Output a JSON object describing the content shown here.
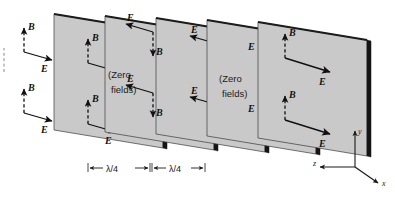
{
  "figure": {
    "kind": "physics-diagram",
    "background_color": "#ffffff",
    "panel_fill": "#c9c9c9",
    "panel_edge": "#151515",
    "ink": "#101010"
  },
  "panels": [
    {
      "id": "panel-1",
      "index": 1,
      "type": "field",
      "label": "",
      "vectors": [
        {
          "name": "B",
          "label": "B",
          "style": "dashed",
          "direction": "up"
        },
        {
          "name": "E",
          "label": "E",
          "style": "solid",
          "direction": "right"
        },
        {
          "name": "B",
          "label": "B",
          "style": "dashed",
          "direction": "up"
        },
        {
          "name": "E",
          "label": "E",
          "style": "solid",
          "direction": "right"
        },
        {
          "name": "B",
          "label": "B",
          "style": "dashed",
          "direction": "up"
        },
        {
          "name": "E",
          "label": "E",
          "style": "solid",
          "direction": "right"
        },
        {
          "name": "B",
          "label": "B",
          "style": "dashed",
          "direction": "up"
        },
        {
          "name": "E",
          "label": "E",
          "style": "solid",
          "direction": "right"
        }
      ]
    },
    {
      "id": "panel-2",
      "index": 2,
      "type": "zero",
      "label": "(Zero\nfields)",
      "label_line1": "(Zero",
      "label_line2": "fields)",
      "vectors": []
    },
    {
      "id": "panel-3",
      "index": 3,
      "type": "field-reversed",
      "label": "",
      "vectors": [
        {
          "name": "E",
          "label": "E",
          "style": "solid",
          "direction": "left"
        },
        {
          "name": "B",
          "label": "B",
          "style": "dashed",
          "direction": "down"
        },
        {
          "name": "E",
          "label": "E",
          "style": "solid",
          "direction": "left"
        },
        {
          "name": "B",
          "label": "B",
          "style": "dashed",
          "direction": "down"
        },
        {
          "name": "E",
          "label": "E",
          "style": "solid",
          "direction": "left"
        },
        {
          "name": "B",
          "label": "B",
          "style": "dashed",
          "direction": "down"
        },
        {
          "name": "E",
          "label": "E",
          "style": "solid",
          "direction": "left"
        },
        {
          "name": "B",
          "label": "B",
          "style": "dashed",
          "direction": "down"
        }
      ]
    },
    {
      "id": "panel-4",
      "index": 4,
      "type": "zero",
      "label": "(Zero\nfields)",
      "label_line1": "(Zero",
      "label_line2": "fields)",
      "vectors": []
    },
    {
      "id": "panel-5",
      "index": 5,
      "type": "field",
      "label": "",
      "vectors": [
        {
          "name": "B",
          "label": "B",
          "style": "dashed",
          "direction": "up"
        },
        {
          "name": "E",
          "label": "E",
          "style": "solid",
          "direction": "right"
        },
        {
          "name": "B",
          "label": "B",
          "style": "dashed",
          "direction": "up"
        },
        {
          "name": "E",
          "label": "E",
          "style": "solid",
          "direction": "right"
        }
      ]
    }
  ],
  "field_labels": {
    "e": "E",
    "b": "B"
  },
  "zero_field_text": {
    "line1": "(Zero",
    "line2": "fields)"
  },
  "dimensions": [
    {
      "id": "dim-1",
      "label": "λ/4"
    },
    {
      "id": "dim-2",
      "label": "λ/4"
    }
  ],
  "axes": {
    "x_label": "x",
    "y_label": "y",
    "z_label": "z"
  }
}
